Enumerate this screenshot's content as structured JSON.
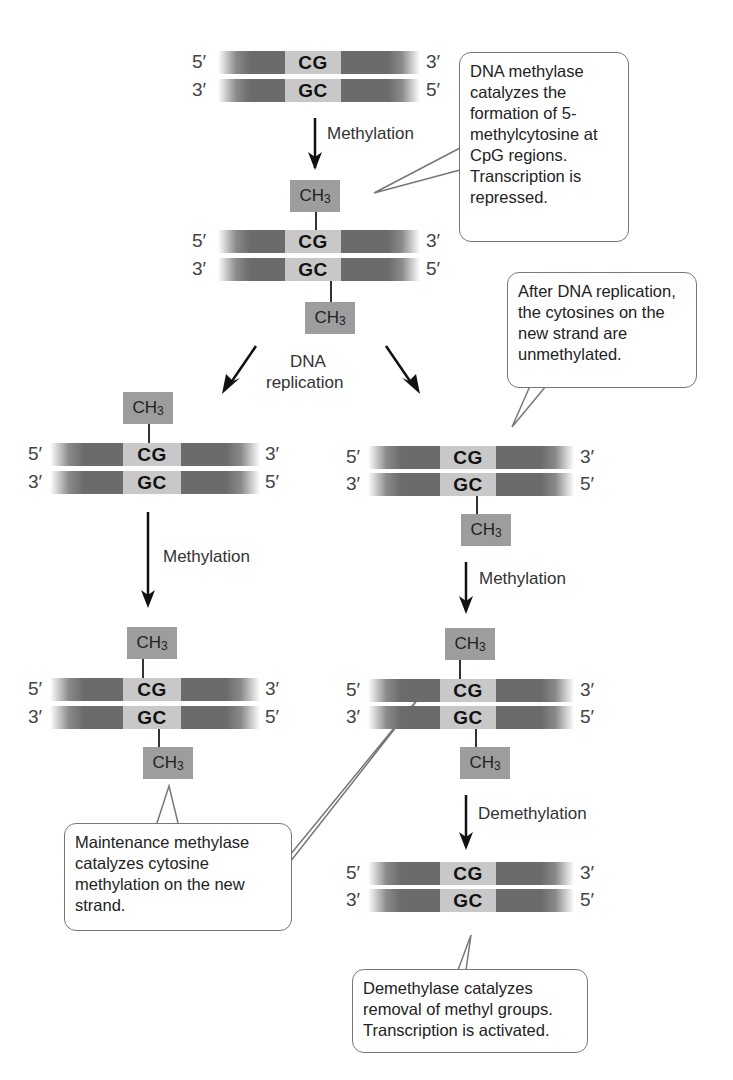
{
  "diagram": {
    "step1": {
      "strand_top": {
        "left": "5′",
        "pair": "CG",
        "right": "3′"
      },
      "strand_bottom": {
        "left": "3′",
        "pair": "GC",
        "right": "5′"
      }
    },
    "arrow1_label": "Methylation",
    "callout1": "DNA methylase catalyzes the formation of 5-methylcytosine at CpG regions. Transcription is repressed.",
    "step2": {
      "ch3_top": "CH",
      "ch3_bottom": "CH",
      "subscript": "3",
      "strand_top": {
        "left": "5′",
        "pair": "CG",
        "right": "3′"
      },
      "strand_bottom": {
        "left": "3′",
        "pair": "GC",
        "right": "5′"
      }
    },
    "replication_label_line1": "DNA",
    "replication_label_line2": "replication",
    "callout2": "After DNA replication, the cytosines on the new strand are unmethylated.",
    "left_branch": {
      "hemi": {
        "ch3_top": "CH",
        "subscript": "3",
        "strand_top": {
          "left": "5′",
          "pair": "CG",
          "right": "3′"
        },
        "strand_bottom": {
          "left": "3′",
          "pair": "GC",
          "right": "5′"
        }
      },
      "arrow_label": "Methylation",
      "full": {
        "ch3_top": "CH",
        "ch3_bottom": "CH",
        "subscript": "3",
        "strand_top": {
          "left": "5′",
          "pair": "CG",
          "right": "3′"
        },
        "strand_bottom": {
          "left": "3′",
          "pair": "GC",
          "right": "5′"
        }
      }
    },
    "right_branch": {
      "hemi": {
        "ch3_bottom": "CH",
        "subscript": "3",
        "strand_top": {
          "left": "5′",
          "pair": "CG",
          "right": "3′"
        },
        "strand_bottom": {
          "left": "3′",
          "pair": "GC",
          "right": "5′"
        }
      },
      "arrow_label": "Methylation",
      "full": {
        "ch3_top": "CH",
        "ch3_bottom": "CH",
        "subscript": "3",
        "strand_top": {
          "left": "5′",
          "pair": "CG",
          "right": "3′"
        },
        "strand_bottom": {
          "left": "3′",
          "pair": "GC",
          "right": "5′"
        }
      },
      "demethylation_label": "Demethylation",
      "final": {
        "strand_top": {
          "left": "5′",
          "pair": "CG",
          "right": "3′"
        },
        "strand_bottom": {
          "left": "3′",
          "pair": "GC",
          "right": "5′"
        }
      }
    },
    "callout3": "Maintenance methylase catalyzes cytosine methylation on the new strand.",
    "callout4": "Demethylase catalyzes removal of methyl groups. Transcription is activated.",
    "colors": {
      "strand_dark": "#6b6b6b",
      "pair_light": "#c8c8c8",
      "ch3_box": "#9d9d9d",
      "callout_border": "#777777"
    }
  }
}
